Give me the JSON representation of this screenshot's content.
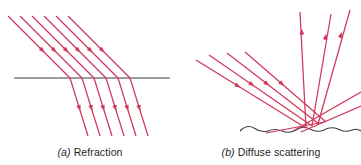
{
  "figure": {
    "type": "optics-ray-diagram",
    "background_color": "#ffffff",
    "ray_color": "#d1365b",
    "surface_color": "#3c3c3c",
    "caption_color": "#231f20",
    "panels": [
      {
        "id": "a",
        "label": "(a)",
        "title": "Refraction",
        "caption_prefix": "(",
        "caption_letter": "a",
        "caption_suffix": ") ",
        "caption_text": "Refraction",
        "interface": {
          "kind": "straight-line",
          "x1": 14,
          "y1": 78,
          "x2": 170,
          "y2": 78
        },
        "incident_rays": {
          "count": 6,
          "angle_label": "about 45 degrees from vertical",
          "direction": "down-right",
          "entry_points_x": [
            70,
            82,
            94,
            106,
            118,
            130
          ],
          "start_offset_x": -62,
          "start_y": 16
        },
        "refracted_rays": {
          "count": 6,
          "angle_label": "about 17 degrees from vertical",
          "direction": "down, slightly right",
          "end_y": 136,
          "end_offset_x": 18
        },
        "arrowheads": {
          "shape": "filled-triangle",
          "incident_position_fraction": 0.55,
          "refracted_position_fraction": 0.48
        }
      },
      {
        "id": "b",
        "label": "(b)",
        "title": "Diffuse scattering",
        "caption_prefix": "(",
        "caption_letter": "b",
        "caption_suffix": ") ",
        "caption_text": "Diffuse scattering",
        "interface": {
          "kind": "wavy-line",
          "x_start": 240,
          "x_end": 361,
          "y_center": 130,
          "amplitude": 4,
          "wavelength": 27
        },
        "incident_rays": {
          "count": 4,
          "angle_label": "about 45 degrees from vertical",
          "direction": "down-right",
          "start_points": [
            [
              196,
              60
            ],
            [
              209,
              56
            ],
            [
              226,
              54
            ],
            [
              243,
              52
            ]
          ],
          "hit_points": [
            [
              306,
              128
            ],
            [
              312,
              126
            ],
            [
              318,
              124
            ],
            [
              324,
              122
            ]
          ]
        },
        "scattered_rays": {
          "count": 6,
          "description": "rays leaving the rough surface in many directions",
          "segments": [
            {
              "from": [
                306,
                128
              ],
              "to": [
                300,
                12
              ]
            },
            {
              "from": [
                312,
                126
              ],
              "to": [
                330,
                14
              ]
            },
            {
              "from": [
                318,
                124
              ],
              "to": [
                349,
                10
              ]
            },
            {
              "from": [
                292,
                130
              ],
              "to": [
                361,
                90
              ]
            },
            {
              "from": [
                324,
                122
              ],
              "to": [
                268,
                132
              ]
            },
            {
              "from": [
                300,
                131
              ],
              "to": [
                358,
                104
              ]
            }
          ]
        },
        "arrowheads": {
          "shape": "filled-triangle",
          "position_fraction": 0.5
        }
      }
    ]
  }
}
